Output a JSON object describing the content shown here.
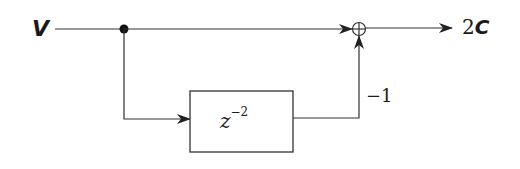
{
  "diagram": {
    "type": "signal-flow block diagram",
    "input": {
      "label": "V"
    },
    "output": {
      "coefficient": "2",
      "variable": "C"
    },
    "delay_block": {
      "base": "z",
      "exponent": "−2"
    },
    "feedback_gain": {
      "label": "−1"
    },
    "summing_junction": {
      "symbol": "⊕"
    },
    "colors": {
      "stroke": "#333333",
      "text": "#1a1a1a",
      "background": "#ffffff"
    }
  }
}
